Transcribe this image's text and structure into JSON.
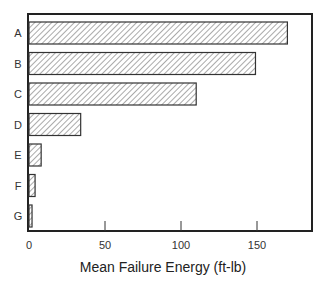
{
  "chart_data": {
    "type": "bar",
    "orientation": "horizontal",
    "title": "",
    "xlabel": "Mean Failure Energy (ft-lb)",
    "ylabel": "",
    "categories": [
      "A",
      "B",
      "C",
      "D",
      "E",
      "F",
      "G"
    ],
    "values": [
      170,
      149,
      110,
      34,
      8,
      4,
      2
    ],
    "xlim": [
      0,
      187
    ],
    "xticks": [
      0,
      50,
      100,
      150
    ],
    "grid": false,
    "legend": null,
    "bar_fill": "diagonal-hatch",
    "colors": {
      "frame": "#222222",
      "bar_edge": "#333333",
      "hatch": "#555555",
      "bar_bg": "#ffffff"
    }
  }
}
